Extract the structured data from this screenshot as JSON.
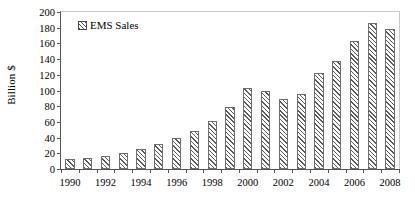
{
  "chart_data": {
    "type": "bar",
    "title": "",
    "xlabel": "",
    "ylabel": "Billion $",
    "ylim": [
      0,
      200
    ],
    "yticks": [
      0,
      20,
      40,
      60,
      80,
      100,
      120,
      140,
      160,
      180,
      200
    ],
    "xtick_labels": [
      "1990",
      "1992",
      "1994",
      "1996",
      "1998",
      "2000",
      "2002",
      "2004",
      "2006",
      "2008"
    ],
    "grid": false,
    "legend": {
      "position": "top-left",
      "entries": [
        "EMS Sales"
      ]
    },
    "categories": [
      "1990",
      "1991",
      "1992",
      "1993",
      "1994",
      "1995",
      "1996",
      "1997",
      "1998",
      "1999",
      "2000",
      "2001",
      "2002",
      "2003",
      "2004",
      "2005",
      "2006",
      "2007",
      "2008"
    ],
    "values": [
      13,
      14,
      17,
      21,
      26,
      32,
      40,
      48,
      61,
      79,
      103,
      100,
      89,
      96,
      122,
      138,
      163,
      186,
      178
    ],
    "series": [
      {
        "name": "EMS Sales",
        "values": [
          13,
          14,
          17,
          21,
          26,
          32,
          40,
          48,
          61,
          79,
          103,
          100,
          89,
          96,
          122,
          138,
          163,
          186,
          178
        ]
      }
    ],
    "colors": {
      "bar_edge": "#6e6e6e",
      "bar_hatch": "#5a5a5a",
      "axis": "#555555",
      "text": "#000000"
    }
  }
}
